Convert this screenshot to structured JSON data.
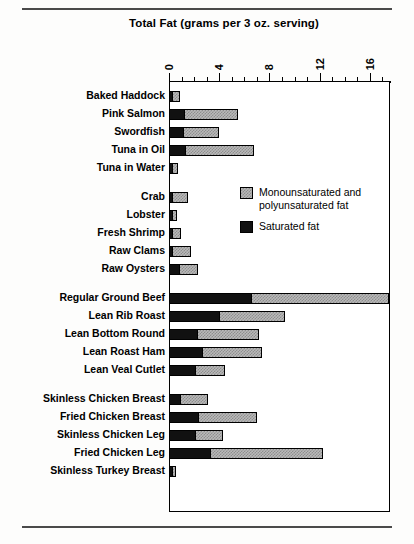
{
  "rules": {
    "top_label": "top-divider-rule",
    "bottom_label": "bottom-divider-rule"
  },
  "legend": {
    "position": "inside-upper-right",
    "entries": [
      {
        "key": "unsaturated",
        "label": "Monounsaturated and polyunsaturated fat",
        "color": "#b9b9b9",
        "pattern": "checkered-gray"
      },
      {
        "key": "saturated",
        "label": "Saturated fat",
        "color": "#111111",
        "pattern": "solid-black"
      }
    ]
  },
  "chart_data": {
    "type": "bar",
    "orientation": "horizontal",
    "stacked": true,
    "title": "Total Fat (grams per 3 oz. serving)",
    "xlabel": "",
    "ylabel": "",
    "xlim": [
      0,
      17.6
    ],
    "xticks": [
      0,
      4,
      8,
      12,
      16
    ],
    "xtick_labels": [
      "0",
      "4",
      "8",
      "12",
      "16"
    ],
    "xtick_label_rotation": 90,
    "minor_tick_interval": 1,
    "grid": false,
    "axis_position": "top",
    "units": "grams per 3 oz. serving",
    "categories": [
      "Baked Haddock",
      "Pink Salmon",
      "Swordfish",
      "Tuna in Oil",
      "Tuna in Water",
      "Crab",
      "Lobster",
      "Fresh Shrimp",
      "Raw Clams",
      "Raw Oysters",
      "Regular Ground Beef",
      "Lean Rib Roast",
      "Lean Bottom Round",
      "Lean Roast Ham",
      "Lean Veal Cutlet",
      "Skinless Chicken Breast",
      "Fried Chicken Breast",
      "Skinless Chicken Leg",
      "Fried Chicken Leg",
      "Skinless Turkey Breast"
    ],
    "series": [
      {
        "name": "Saturated fat",
        "color": "#111111",
        "values": [
          0.2,
          1.2,
          1.1,
          1.3,
          0.2,
          0.2,
          0.1,
          0.2,
          0.2,
          0.8,
          6.5,
          4.0,
          2.2,
          2.6,
          2.1,
          0.9,
          2.3,
          2.1,
          3.3,
          0.2
        ]
      },
      {
        "name": "Monounsaturated and polyunsaturated fat",
        "color": "#b9b9b9",
        "values": [
          0.6,
          4.3,
          2.9,
          5.5,
          0.5,
          1.3,
          0.4,
          0.7,
          1.5,
          1.5,
          11.0,
          5.2,
          5.0,
          4.8,
          2.4,
          2.2,
          4.7,
          2.2,
          9.0,
          0.3
        ]
      }
    ],
    "group_breaks_after": [
      "Tuna in Water",
      "Raw Oysters",
      "Lean Veal Cutlet"
    ]
  }
}
